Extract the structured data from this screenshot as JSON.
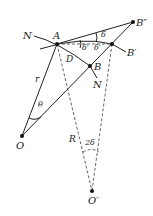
{
  "diagram": {
    "points": {
      "A": "A",
      "B": "B",
      "B_prime": "B′",
      "B_double_prime": "B″",
      "D": "D",
      "N_top": "N",
      "N_bottom": "N",
      "O": "O",
      "O_prime": "O′"
    },
    "segments": {
      "r": "r",
      "R": "R"
    },
    "angles": {
      "theta": "θ",
      "delta": "δ",
      "delta_prime_1": "δ′",
      "delta_prime_2": "δ′",
      "two_delta": "2δ"
    },
    "colors": {
      "stroke": "#222222",
      "dashed": "#555555"
    }
  }
}
